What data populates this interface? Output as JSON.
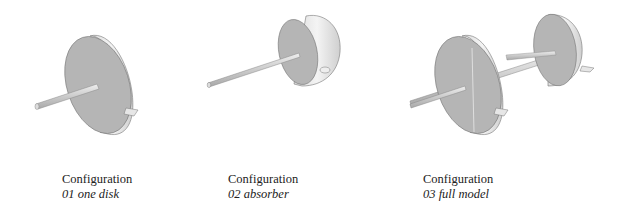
{
  "panels": [
    {
      "label": "Configuration",
      "name": "01 one disk"
    },
    {
      "label": "Configuration",
      "name": "02 absorber"
    },
    {
      "label": "Configuration",
      "name": "03 full model"
    }
  ],
  "colors": {
    "disk_face": "#b4b4b4",
    "disk_rim": "#e6e6e6",
    "shaft": "#cfcfcf",
    "outline": "#7a7a7a"
  }
}
